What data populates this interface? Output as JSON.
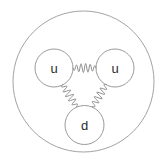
{
  "diagram": {
    "background_color": "#ffffff",
    "line_color": "#9a9a9a",
    "label_color": "#2b2b2b",
    "containment": {
      "name": "proton-boundary",
      "cx": 83.5,
      "cy": 81.5,
      "r": 70.5
    },
    "quarks": [
      {
        "id": "quark-u-left",
        "label": "u",
        "cx": 54,
        "cy": 68,
        "r": 19
      },
      {
        "id": "quark-u-right",
        "label": "u",
        "cx": 115,
        "cy": 68,
        "r": 19
      },
      {
        "id": "quark-d-bottom",
        "label": "d",
        "cx": 84.5,
        "cy": 125,
        "r": 19.5
      }
    ],
    "gluons": [
      {
        "id": "gluon-u-left-to-u-right",
        "from": "quark-u-left",
        "to": "quark-u-right",
        "x1": 73,
        "y1": 68,
        "x2": 96,
        "y2": 68,
        "cycles": 5,
        "amplitude": 4.5
      },
      {
        "id": "gluon-u-left-to-d",
        "from": "quark-u-left",
        "to": "quark-d-bottom",
        "x1": 62.5,
        "y1": 84.5,
        "x2": 76.5,
        "y2": 106.5,
        "cycles": 5,
        "amplitude": 4
      },
      {
        "id": "gluon-u-right-to-d",
        "from": "quark-u-right",
        "to": "quark-d-bottom",
        "x1": 106.5,
        "y1": 84.5,
        "x2": 92.5,
        "y2": 106.5,
        "cycles": 5,
        "amplitude": 4
      }
    ]
  }
}
